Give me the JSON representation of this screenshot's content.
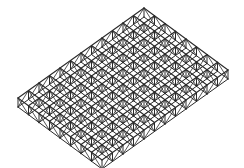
{
  "diagram": {
    "type": "isometric-space-frame-grid",
    "stroke_color": "#2a2a2a",
    "background": "#ffffff",
    "top_vertex": [
      144,
      8
    ],
    "left_vertex": [
      18,
      98
    ],
    "right_vertex": [
      228,
      70
    ],
    "cells_along_left_edge": 12,
    "cells_along_right_edge": 8,
    "layer_offset_y": 9
  }
}
